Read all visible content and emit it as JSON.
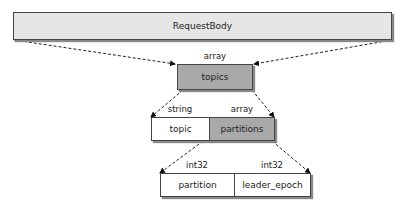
{
  "diagram": {
    "root": {
      "label": "RequestBody"
    },
    "topics": {
      "type": "array",
      "label": "topics"
    },
    "topic": {
      "type": "string",
      "label": "topic"
    },
    "partitions": {
      "type": "array",
      "label": "partitions"
    },
    "partition": {
      "type": "int32",
      "label": "partition"
    },
    "leader_epoch": {
      "type": "int32",
      "label": "leader_epoch"
    }
  },
  "colors": {
    "root_fill": "#e6e6e6",
    "array_fill": "#a9a9a9",
    "leaf_fill": "#ffffff",
    "border": "#444444"
  }
}
